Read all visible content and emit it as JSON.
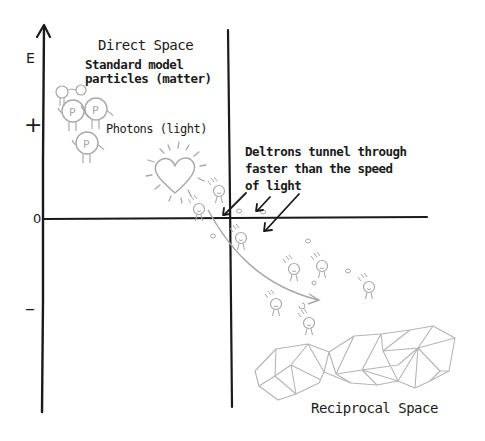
{
  "diagram": {
    "regions": {
      "direct_space": "Direct Space",
      "reciprocal_space": "Reciprocal Space"
    },
    "labels": {
      "matter": [
        "Standard model",
        "particles (matter)"
      ],
      "photons": "Photons (light)",
      "deltrons": [
        "Deltrons tunnel through",
        "faster than the speed",
        "of light"
      ]
    },
    "axis": {
      "label": "E",
      "ticks": [
        "+",
        "0",
        "–"
      ]
    },
    "colors": {
      "ink": "#1a1a1a",
      "sketch": "#a8a8a8",
      "background": "#ffffff"
    },
    "icons": {
      "heart": "heart-icon",
      "particle": "particle-figure-icon",
      "lattice": "reciprocal-lattice-mesh"
    }
  }
}
